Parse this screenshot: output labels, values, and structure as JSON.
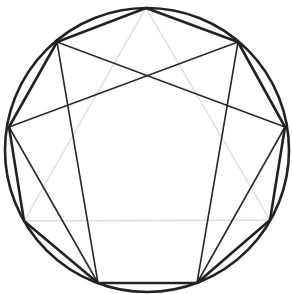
{
  "diagram": {
    "title": "",
    "type": "enneagram",
    "background": "#ffffff",
    "circle": {
      "cx": 147,
      "cy": 150,
      "r": 142,
      "stroke": "#222222",
      "stroke_width": 2.6
    },
    "points": [
      {
        "id": "9",
        "x": 146,
        "y": 8
      },
      {
        "id": "1",
        "x": 238,
        "y": 42
      },
      {
        "id": "2",
        "x": 285,
        "y": 127
      },
      {
        "id": "3",
        "x": 270,
        "y": 220
      },
      {
        "id": "4",
        "x": 197,
        "y": 283
      },
      {
        "id": "5",
        "x": 98,
        "y": 283
      },
      {
        "id": "6",
        "x": 24,
        "y": 221
      },
      {
        "id": "7",
        "x": 9,
        "y": 127
      },
      {
        "id": "8",
        "x": 57,
        "y": 42
      }
    ],
    "nonagon": {
      "order": [
        "9",
        "1",
        "2",
        "3",
        "4",
        "5",
        "6",
        "7",
        "8"
      ],
      "stroke": "#222222",
      "stroke_width": 2.6
    },
    "triangle": {
      "order": [
        "9",
        "3",
        "6"
      ],
      "stroke": "#dddddd",
      "stroke_width": 1.4
    },
    "hexad": {
      "order": [
        "1",
        "4",
        "2",
        "8",
        "5",
        "7"
      ],
      "stroke": "#2a2a2a",
      "stroke_width": 1.6
    }
  }
}
